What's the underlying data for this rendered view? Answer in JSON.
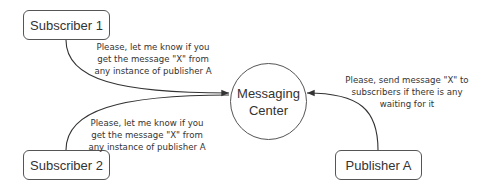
{
  "nodes": {
    "subscriber1": {
      "label": "Subscriber 1"
    },
    "subscriber2": {
      "label": "Subscriber 2"
    },
    "center": {
      "line1": "Messaging",
      "line2": "Center"
    },
    "publisher": {
      "label": "Publisher A"
    }
  },
  "notes": {
    "sub1": [
      "Please, let me know if you",
      "get the message \"X\" from",
      "any instance of publisher A"
    ],
    "sub2": [
      "Please, let me know if you",
      "get the message \"X\" from",
      "any instance of publisher A"
    ],
    "pub": [
      "Please, send message \"X\" to",
      "subscribers if there is any",
      "waiting for it"
    ]
  },
  "colors": {
    "stroke": "#333333",
    "text": "#333333",
    "background": "#ffffff"
  }
}
